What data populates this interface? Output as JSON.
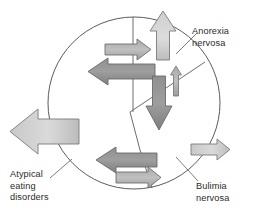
{
  "figure": {
    "type": "venn-like-circle-diagram",
    "background": "#ffffff",
    "outline_color": "#555555",
    "arrow_fill_light": "#d6d6d6",
    "arrow_fill_mid": "#b3b3b3",
    "arrow_fill_dark": "#8c8c8c",
    "arrow_stroke": "#707070",
    "text_color": "#2b2b2b"
  },
  "labels": {
    "anorexia": "Anorexia\nnervosa",
    "bulimia": "Bulimia\nnervosa",
    "atypical": "Atypical\neating\ndisorders"
  },
  "regions": [
    {
      "name": "anorexia-nervosa",
      "position": "upper-right-of-circle"
    },
    {
      "name": "bulimia-nervosa",
      "position": "lower-right-of-circle"
    },
    {
      "name": "atypical-eating-disorders",
      "position": "left-of-circle"
    }
  ],
  "arrows": [
    {
      "name": "up-arrow-large",
      "direction": "up",
      "size": "large",
      "shade": "light"
    },
    {
      "name": "right-arrow-upper",
      "direction": "right",
      "size": "medium",
      "shade": "mid"
    },
    {
      "name": "left-arrow-upper",
      "direction": "left",
      "size": "large",
      "shade": "dark"
    },
    {
      "name": "up-arrow-small",
      "direction": "up",
      "size": "small",
      "shade": "mid"
    },
    {
      "name": "down-arrow-large",
      "direction": "down",
      "size": "large",
      "shade": "dark"
    },
    {
      "name": "left-arrow-outer",
      "direction": "left",
      "size": "xlarge",
      "shade": "light"
    },
    {
      "name": "left-arrow-lower",
      "direction": "left",
      "size": "large",
      "shade": "dark"
    },
    {
      "name": "right-arrow-lower",
      "direction": "right",
      "size": "medium",
      "shade": "mid"
    },
    {
      "name": "right-arrow-bulimia",
      "direction": "right",
      "size": "medium",
      "shade": "light"
    }
  ]
}
